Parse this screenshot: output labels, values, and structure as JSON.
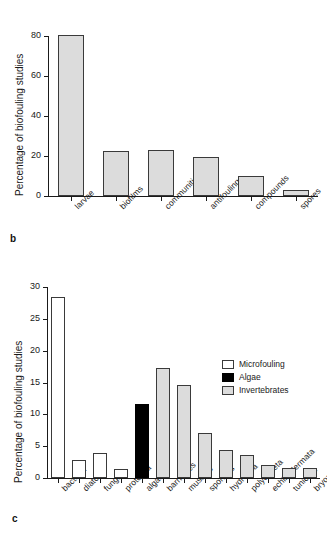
{
  "figure": {
    "panels": [
      {
        "letter": "b",
        "chart_data": {
          "type": "bar",
          "title": "",
          "xlabel": "",
          "ylabel": "Percentage of biofouling studies",
          "ylim": [
            0,
            85
          ],
          "yticks": [
            0,
            20,
            40,
            60,
            80
          ],
          "ytick_labels": [
            "0",
            "20",
            "40",
            "60",
            "80"
          ],
          "grid": false,
          "legend": null,
          "categories": [
            "larvae",
            "biofilms",
            "communities",
            "antifouling",
            "compounds",
            "spores"
          ],
          "values": [
            80.4,
            22.6,
            23.1,
            19.3,
            10.0,
            2.9
          ],
          "series": [
            {
              "name": "Percentage of biofouling studies",
              "values": [
                80.4,
                22.6,
                23.1,
                19.3,
                10.0,
                2.9
              ],
              "colors": [
                "#dcdcdc",
                "#dcdcdc",
                "#dcdcdc",
                "#dcdcdc",
                "#dcdcdc",
                "#dcdcdc"
              ]
            }
          ]
        }
      },
      {
        "letter": "c",
        "chart_data": {
          "type": "bar",
          "title": "",
          "xlabel": "",
          "ylabel": "Percentage of biofouling studies",
          "ylim": [
            0,
            30
          ],
          "yticks": [
            0,
            5,
            10,
            15,
            20,
            25,
            30
          ],
          "ytick_labels": [
            "0",
            "5",
            "10",
            "15",
            "20",
            "25",
            "30"
          ],
          "grid": false,
          "legend": {
            "position": "upper right",
            "entries": [
              {
                "label": "Microfouling",
                "color": "#ffffff"
              },
              {
                "label": "Algae",
                "color": "#000000"
              },
              {
                "label": "Invertebrates",
                "color": "#dcdcdc"
              }
            ]
          },
          "categories": [
            "bacteria",
            "diatoms",
            "fungi",
            "protozoa",
            "algae",
            "barnacles",
            "mussels",
            "sponges",
            "hydrozoa",
            "polychaeta",
            "echinodermata",
            "tunicata",
            "bryozoa"
          ],
          "values": [
            28.5,
            2.8,
            3.9,
            1.4,
            11.7,
            17.3,
            14.6,
            7.0,
            4.4,
            3.6,
            2.1,
            1.5,
            1.6
          ],
          "groups": [
            "Microfouling",
            "Microfouling",
            "Microfouling",
            "Microfouling",
            "Algae",
            "Invertebrates",
            "Invertebrates",
            "Invertebrates",
            "Invertebrates",
            "Invertebrates",
            "Invertebrates",
            "Invertebrates",
            "Invertebrates"
          ],
          "series": [
            {
              "name": "Percentage of biofouling studies",
              "values": [
                28.5,
                2.8,
                3.9,
                1.4,
                11.7,
                17.3,
                14.6,
                7.0,
                4.4,
                3.6,
                2.1,
                1.5,
                1.6
              ],
              "colors": [
                "#ffffff",
                "#ffffff",
                "#ffffff",
                "#ffffff",
                "#000000",
                "#dcdcdc",
                "#dcdcdc",
                "#dcdcdc",
                "#dcdcdc",
                "#dcdcdc",
                "#dcdcdc",
                "#dcdcdc",
                "#dcdcdc"
              ]
            }
          ]
        }
      }
    ]
  }
}
